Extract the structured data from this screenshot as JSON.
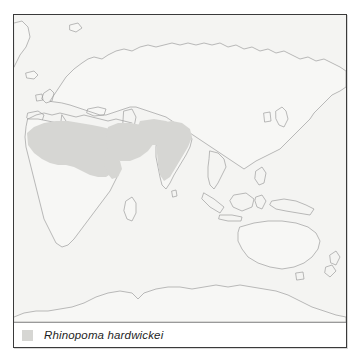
{
  "figure": {
    "type": "species-distribution-map",
    "projection_note": "Eastern Hemisphere world map"
  },
  "legend": {
    "swatch_color": "#d6d6d3",
    "species_name": "Rhinopoma hardwickei"
  },
  "map": {
    "ocean_color": "#f4f4f2",
    "land_color": "#f7f7f5",
    "coastline_color": "#9d9d9d",
    "range_color": "#d6d6d3",
    "range_regions": [
      "North Africa",
      "Sahel",
      "Arabian Peninsula",
      "Middle East",
      "Iran",
      "Indian subcontinent"
    ]
  },
  "frame": {
    "border_color": "#3a3a3a"
  }
}
